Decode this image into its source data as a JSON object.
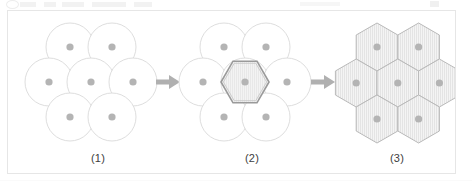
{
  "figure": {
    "kind": "process-diagram",
    "border_color": "#e6e6e6",
    "background_color": "#ffffff",
    "stages": [
      {
        "index": 1,
        "caption": "(1)",
        "shape": "circle",
        "count": 7,
        "arrangement": "hexagonal-packing",
        "outline_color": "#dcdcdc",
        "fill_color": "#ffffff",
        "center_dot_color": "#b4b4b4",
        "highlighted": false,
        "hatched": false
      },
      {
        "index": 2,
        "caption": "(2)",
        "shape": "circle",
        "count": 7,
        "arrangement": "hexagonal-packing",
        "outline_color": "#dcdcdc",
        "fill_color": "#ffffff",
        "center_dot_color": "#b4b4b4",
        "highlighted": true,
        "highlight_shape": "hexagon",
        "highlight_outline_color": "#9a9a9a",
        "highlight_fill_color": "#f2f2f2",
        "hatched": true
      },
      {
        "index": 3,
        "caption": "(3)",
        "shape": "hexagon",
        "count": 7,
        "arrangement": "tessellation",
        "outline_color": "#b9b9b9",
        "fill_color": "#f4f4f4",
        "center_dot_color": "#b4b4b4",
        "highlighted": false,
        "hatched": true
      }
    ],
    "arrows": [
      {
        "index": 1,
        "from_stage": 1,
        "to_stage": 2,
        "direction": "right",
        "color": "#b0b0b0"
      },
      {
        "index": 2,
        "from_stage": 2,
        "to_stage": 3,
        "direction": "right",
        "color": "#b0b0b0"
      }
    ],
    "geometry": {
      "circle_radius": 24,
      "hex_radius": 24,
      "center_dot_radius": 3.6,
      "cluster_1_center": {
        "x": 90,
        "y": 78
      },
      "cluster_2_center": {
        "x": 244,
        "y": 78
      },
      "cluster_3_center": {
        "x": 390,
        "y": 78
      },
      "arrow_1_x": 160,
      "arrow_2_x": 316,
      "arrow_y": 78
    }
  }
}
